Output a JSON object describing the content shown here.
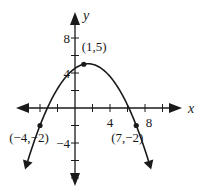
{
  "chart_data": {
    "type": "line",
    "title": "",
    "xlabel": "x",
    "ylabel": "y",
    "xlim": [
      -8,
      10
    ],
    "ylim": [
      -10,
      10
    ],
    "grid": false,
    "x_tick_step": 2,
    "y_tick_step": 2,
    "x_tick_labels": [
      {
        "value": 4,
        "text": "4"
      },
      {
        "value": 8,
        "text": "8"
      }
    ],
    "y_tick_labels": [
      {
        "value": 8,
        "text": "8"
      },
      {
        "value": 4,
        "text": "4"
      },
      {
        "value": -4,
        "text": "−4"
      }
    ],
    "series": [
      {
        "name": "parabola",
        "function": "y = -(7/30)(x+4)(x-7) - 2",
        "x_range": [
          -5.4,
          8.4
        ],
        "color": "#1a1a1a"
      }
    ],
    "points": [
      {
        "x": 1,
        "y": 5,
        "label": "(1,5)"
      },
      {
        "x": -4,
        "y": -2,
        "label": "(−4,−2)"
      },
      {
        "x": 7,
        "y": -2,
        "label": "(7,−2)"
      }
    ]
  },
  "colors": {
    "ink": "#1a1a1a",
    "background": "#ffffff"
  }
}
